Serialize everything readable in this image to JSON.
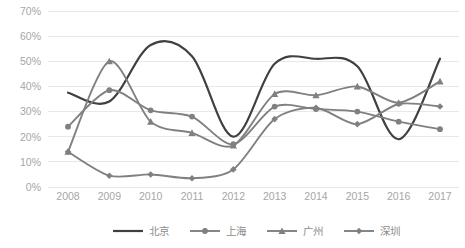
{
  "chart_data": {
    "type": "line",
    "title": "",
    "subtitle": "",
    "xlabel": "",
    "ylabel": "",
    "categories": [
      "2008",
      "2009",
      "2010",
      "2011",
      "2012",
      "2013",
      "2014",
      "2015",
      "2016",
      "2017"
    ],
    "ylim": [
      0,
      70
    ],
    "ytick_values": [
      0,
      10,
      20,
      30,
      40,
      50,
      60,
      70
    ],
    "ytick_labels": [
      "0%",
      "10%",
      "20%",
      "30%",
      "40%",
      "50%",
      "60%",
      "70%"
    ],
    "grid": "horizontal",
    "legend_position": "bottom",
    "smoothing": "spline",
    "series": [
      {
        "name": "北京",
        "marker": "none",
        "color": "#404040",
        "values": [
          37.5,
          34.0,
          56.5,
          52.0,
          20.0,
          49.0,
          51.0,
          48.0,
          19.0,
          51.0
        ]
      },
      {
        "name": "上海",
        "marker": "circle",
        "color": "#808080",
        "values": [
          24.0,
          38.5,
          30.5,
          28.0,
          17.0,
          32.0,
          31.0,
          30.0,
          26.0,
          23.0
        ]
      },
      {
        "name": "广州",
        "marker": "triangle",
        "color": "#808080",
        "values": [
          14.0,
          50.0,
          26.0,
          21.5,
          16.5,
          37.0,
          36.5,
          40.0,
          33.5,
          42.0
        ]
      },
      {
        "name": "深圳",
        "marker": "diamond",
        "color": "#808080",
        "values": [
          14.0,
          4.5,
          5.0,
          3.5,
          7.0,
          27.0,
          31.5,
          25.0,
          33.0,
          32.0
        ]
      }
    ]
  },
  "axes": {
    "y_ticks": [
      "0%",
      "10%",
      "20%",
      "30%",
      "40%",
      "50%",
      "60%",
      "70%"
    ],
    "x_ticks": [
      "2008",
      "2009",
      "2010",
      "2011",
      "2012",
      "2013",
      "2014",
      "2015",
      "2016",
      "2017"
    ]
  },
  "legend": {
    "items": [
      {
        "label": "北京",
        "marker": "none"
      },
      {
        "label": "上海",
        "marker": "circle"
      },
      {
        "label": "广州",
        "marker": "triangle"
      },
      {
        "label": "深圳",
        "marker": "diamond"
      }
    ]
  },
  "colors": {
    "background": "#ffffff",
    "gridline": "#e8e8e8",
    "tick_text": "#a6a6a6",
    "legend_text": "#8c8c8c",
    "series_dark": "#404040",
    "series_gray": "#808080"
  }
}
